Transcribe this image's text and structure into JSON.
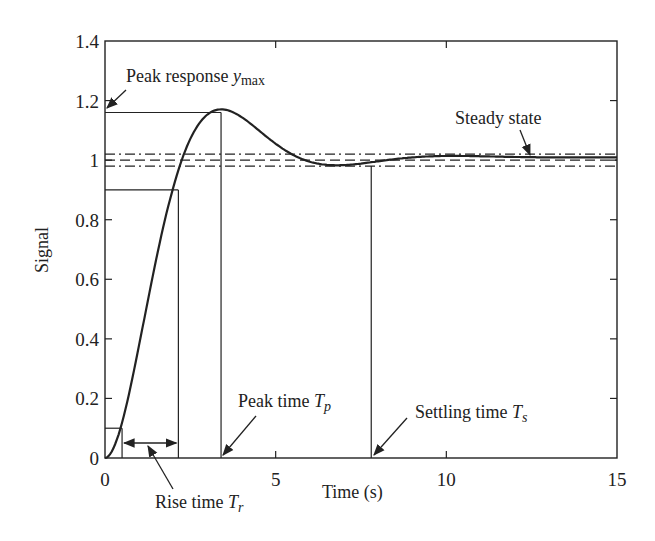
{
  "chart_data": {
    "type": "line",
    "title": "",
    "xlabel": "Time (s)",
    "ylabel": "Signal",
    "xlim": [
      0,
      15
    ],
    "ylim": [
      0,
      1.4
    ],
    "grid": false,
    "x_ticks": [
      0,
      5,
      10,
      15
    ],
    "y_ticks": [
      0,
      0.2,
      0.4,
      0.6,
      0.8,
      1,
      1.2,
      1.4
    ],
    "x_tick_labels": [
      "0",
      "5",
      "10",
      "15"
    ],
    "y_tick_labels": [
      "0",
      "0.2",
      "0.4",
      "0.6",
      "0.8",
      "1",
      "1.2",
      "1.4"
    ],
    "series": [
      {
        "name": "step response",
        "x": [
          0,
          0.5,
          1,
          1.5,
          2,
          2.5,
          3,
          3.4,
          4,
          5,
          6,
          6.8,
          7.5,
          8,
          9,
          10,
          12,
          15
        ],
        "values": [
          0,
          0.118,
          0.377,
          0.663,
          0.903,
          1.065,
          1.146,
          1.163,
          1.136,
          1.046,
          0.985,
          0.974,
          0.979,
          0.987,
          0.999,
          1.004,
          1.008,
          1.01
        ]
      }
    ],
    "reference_lines": {
      "steady_state": 1.0,
      "upper_band": 1.02,
      "lower_band": 0.98,
      "rise_low": 0.1,
      "rise_high": 0.9,
      "peak_value": 1.16
    },
    "markers": {
      "rise_start_time": 0.5,
      "rise_end_time": 2.15,
      "peak_time": 3.4,
      "settling_time": 7.8
    },
    "annotations": [
      {
        "id": "peak",
        "text": "Peak response ",
        "math": "y",
        "sub": "max"
      },
      {
        "id": "steady",
        "text": "Steady state"
      },
      {
        "id": "rise",
        "text": "Rise time ",
        "math": "T",
        "sub": "r"
      },
      {
        "id": "peak_time",
        "text": "Peak time ",
        "math": "T",
        "sub": "p"
      },
      {
        "id": "settling",
        "text": "Settling time ",
        "math": "T",
        "sub": "s"
      }
    ]
  },
  "labels": {
    "xlabel": "Time (s)",
    "ylabel": "Signal",
    "peak_text": "Peak response ",
    "peak_math": "y",
    "peak_sub": "max",
    "steady_text": "Steady state",
    "rise_text": "Rise time ",
    "rise_math": "T",
    "rise_sub": "r",
    "peaktime_text": "Peak time ",
    "peaktime_math": "T",
    "peaktime_sub": "p",
    "settling_text": "Settling time ",
    "settling_math": "T",
    "settling_sub": "s"
  }
}
